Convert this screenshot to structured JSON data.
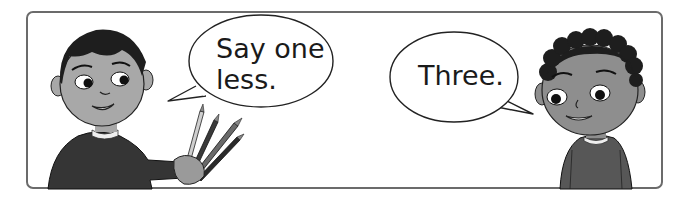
{
  "scene": {
    "left_character": {
      "description": "boy with straight dark hair holding pencils",
      "speech": "Say one\nless."
    },
    "right_character": {
      "description": "boy with curly dark hair",
      "speech": "Three."
    },
    "colors": {
      "frame": "#6b6b6b",
      "skin": "#a8a8a8",
      "hair": "#1e1e1e",
      "sweater": "#3a3a3a",
      "sweater_right": "#5a5a5a"
    }
  }
}
